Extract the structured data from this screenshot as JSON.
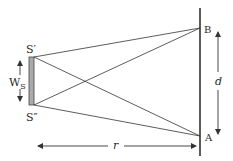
{
  "diagram": {
    "type": "geometry-optics",
    "colors": {
      "line": "#333333",
      "source_fill": "#aaaaaa"
    },
    "labels": {
      "source_top": "S′",
      "source_bottom": "S″",
      "source_width": "W",
      "source_width_sub": "S",
      "point_b": "B",
      "point_a": "A",
      "separation": "d",
      "distance": "r"
    },
    "points": {
      "S_top": [
        32,
        57
      ],
      "S_bottom": [
        32,
        105
      ],
      "B": [
        200,
        28
      ],
      "A": [
        200,
        136
      ]
    },
    "rays": [
      {
        "from": "S_top",
        "to": "B"
      },
      {
        "from": "S_top",
        "to": "A"
      },
      {
        "from": "S_bottom",
        "to": "B"
      },
      {
        "from": "S_bottom",
        "to": "A"
      }
    ]
  }
}
